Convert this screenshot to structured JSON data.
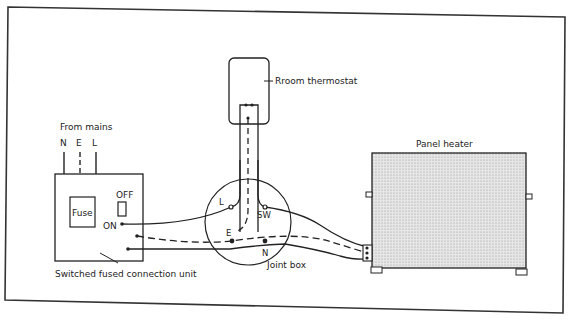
{
  "diagram": {
    "labels": {
      "thermostat": "Rroom thermostat",
      "from_mains": "From mains",
      "mains_n": "N",
      "mains_e": "E",
      "mains_l": "L",
      "fuse": "Fuse",
      "off": "OFF",
      "on": "ON",
      "sfcu": "Switched fused connection unit",
      "panel_heater": "Panel heater",
      "joint_box": "Joint box",
      "terminal_l": "L",
      "terminal_sw": "SW",
      "terminal_e": "E",
      "terminal_n": "N"
    },
    "colors": {
      "line": "#222222",
      "heater_fill": "#d9d9d9",
      "background": "#ffffff"
    }
  }
}
